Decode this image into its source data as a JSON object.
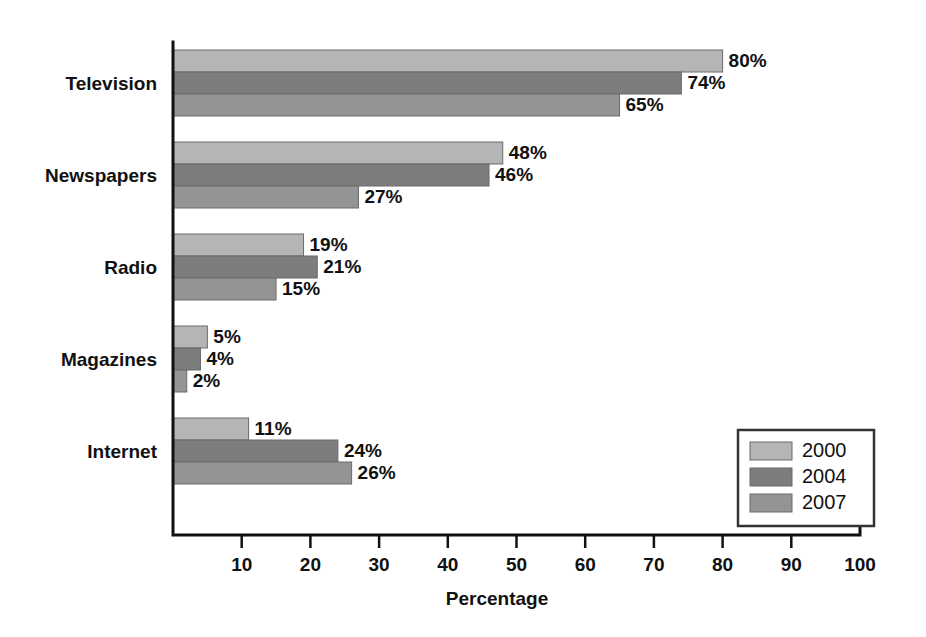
{
  "chart_data": {
    "type": "bar",
    "orientation": "horizontal",
    "title": "",
    "xlabel": "Percentage",
    "ylabel": "",
    "xlim": [
      0,
      100
    ],
    "xticks": [
      10,
      20,
      30,
      40,
      50,
      60,
      70,
      80,
      90,
      100
    ],
    "grid": false,
    "legend_position": "bottom-right",
    "categories": [
      "Television",
      "Newspapers",
      "Radio",
      "Magazines",
      "Internet"
    ],
    "series": [
      {
        "name": "2000",
        "color": "#b5b5b5",
        "values": [
          80,
          48,
          19,
          5,
          11
        ],
        "labels": [
          "80%",
          "48%",
          "19%",
          "5%",
          "11%"
        ]
      },
      {
        "name": "2004",
        "color": "#7d7d7d",
        "values": [
          74,
          46,
          21,
          4,
          24
        ],
        "labels": [
          "74%",
          "46%",
          "21%",
          "4%",
          "24%"
        ]
      },
      {
        "name": "2007",
        "color": "#949494",
        "values": [
          65,
          27,
          15,
          2,
          26
        ],
        "labels": [
          "65%",
          "27%",
          "15%",
          "2%",
          "26%"
        ]
      }
    ]
  },
  "axis": {
    "tick_labels": [
      "10",
      "20",
      "30",
      "40",
      "50",
      "60",
      "70",
      "80",
      "90",
      "100"
    ],
    "x_axis_title": "Percentage"
  },
  "legend": {
    "entries": [
      {
        "label": "2000",
        "color": "#b5b5b5"
      },
      {
        "label": "2004",
        "color": "#7d7d7d"
      },
      {
        "label": "2007",
        "color": "#949494"
      }
    ]
  }
}
